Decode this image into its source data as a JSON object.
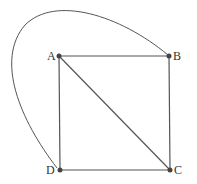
{
  "diagram": {
    "type": "graph",
    "nodes": [
      {
        "id": "A",
        "label": "A",
        "x": 59,
        "y": 56
      },
      {
        "id": "B",
        "label": "B",
        "x": 169,
        "y": 56
      },
      {
        "id": "C",
        "label": "C",
        "x": 170,
        "y": 170
      },
      {
        "id": "D",
        "label": "D",
        "x": 60,
        "y": 170
      }
    ],
    "edges": [
      {
        "from": "A",
        "to": "B",
        "style": "straight"
      },
      {
        "from": "B",
        "to": "C",
        "style": "straight"
      },
      {
        "from": "C",
        "to": "D",
        "style": "straight"
      },
      {
        "from": "D",
        "to": "A",
        "style": "straight"
      },
      {
        "from": "A",
        "to": "C",
        "style": "straight"
      },
      {
        "from": "D",
        "to": "B",
        "style": "curved"
      }
    ],
    "colors": {
      "line": "#555555",
      "node": "#444444",
      "label": "#333333"
    }
  }
}
